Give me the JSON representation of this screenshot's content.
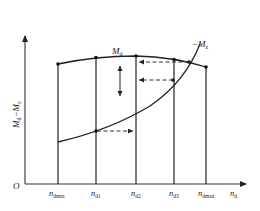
{
  "diagram": {
    "type": "characteristic-curve-diagram",
    "y_axis_label": {
      "main": "M",
      "sub1": "d",
      "sep": "−",
      "main2": "M",
      "sub2": "z"
    },
    "x_axis_label": {
      "main": "n",
      "sub": "d"
    },
    "origin_label": "O",
    "curves": [
      {
        "name": "M_d",
        "label_main": "M",
        "label_sub": "d",
        "description": "upper curve through vertical line tops"
      },
      {
        "name": "-M_z",
        "label_main": "−M",
        "label_sub": "z",
        "description": "rising curve intersecting M_d"
      }
    ],
    "x_ticks": [
      {
        "main": "n",
        "sub": "dmin"
      },
      {
        "main": "n",
        "sub": "d1"
      },
      {
        "main": "n",
        "sub": "d2"
      },
      {
        "main": "n",
        "sub": "d3"
      },
      {
        "main": "n",
        "sub": "dmax"
      }
    ],
    "annotations": [
      "vertical double-headed arrow between n_dmin..n_d2 region",
      "dashed arrows pointing toward n_d2 line"
    ],
    "colors": {
      "line": "#222222",
      "background": "#ffffff"
    }
  }
}
